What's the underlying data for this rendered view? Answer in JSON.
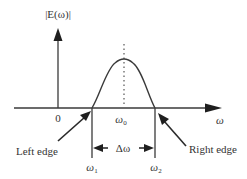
{
  "diagram": {
    "type": "spectrum-bandwidth",
    "y_axis_label": "|E(ω)|",
    "x_axis_label": "ω",
    "origin_label": "0",
    "center_label": "ω",
    "center_subscript": "0",
    "left_freq_label": "ω",
    "left_freq_subscript": "1",
    "right_freq_label": "ω",
    "right_freq_subscript": "2",
    "bandwidth_label": "Δω",
    "left_edge_label": "Left edge",
    "right_edge_label": "Right edge",
    "colors": {
      "stroke": "#3a3a3a",
      "text": "#333333",
      "background": "#ffffff"
    }
  }
}
